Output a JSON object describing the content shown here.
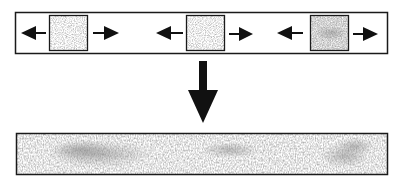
{
  "diagram": {
    "top_strip": {
      "patches": [
        {
          "name": "patch-1",
          "texture_density": "light"
        },
        {
          "name": "patch-2",
          "texture_density": "light"
        },
        {
          "name": "patch-3",
          "texture_density": "dense"
        }
      ],
      "arrows_per_patch": [
        "left",
        "right"
      ]
    },
    "transition_arrow": {
      "direction": "down"
    },
    "bottom_strip": {
      "content": "merged continuous texture"
    },
    "colors": {
      "stroke": "#1a1a1a",
      "arrow_fill": "#111111",
      "texture": "#7a7a7a",
      "background": "#ffffff"
    }
  }
}
